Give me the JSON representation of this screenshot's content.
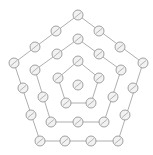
{
  "diagram": {
    "type": "concentric-pentagons",
    "colors": {
      "line": "#9a9a9a",
      "node_stroke": "#8a8a8a",
      "node_fill": "#f2f2f2",
      "background": "#ffffff"
    },
    "node_radius": 5,
    "rings": [
      {
        "name": "outer",
        "polygon": [
          [
            78,
            15
          ],
          [
            143,
            63
          ],
          [
            118,
            141
          ],
          [
            40,
            141
          ],
          [
            14,
            63
          ]
        ],
        "nodes": [
          [
            78,
            15
          ],
          [
            99,
            31
          ],
          [
            120,
            47
          ],
          [
            143,
            63
          ],
          [
            133,
            88
          ],
          [
            125,
            115
          ],
          [
            118,
            141
          ],
          [
            91,
            141
          ],
          [
            65,
            141
          ],
          [
            40,
            141
          ],
          [
            31,
            115
          ],
          [
            23,
            88
          ],
          [
            14,
            63
          ],
          [
            35,
            47
          ],
          [
            56,
            31
          ]
        ]
      },
      {
        "name": "middle",
        "polygon": [
          [
            78,
            39
          ],
          [
            121,
            70
          ],
          [
            104,
            122
          ],
          [
            51,
            122
          ],
          [
            35,
            70
          ]
        ],
        "nodes": [
          [
            78,
            39
          ],
          [
            99,
            54
          ],
          [
            121,
            70
          ],
          [
            113,
            97
          ],
          [
            104,
            122
          ],
          [
            78,
            122
          ],
          [
            51,
            122
          ],
          [
            43,
            97
          ],
          [
            35,
            70
          ],
          [
            57,
            54
          ]
        ]
      },
      {
        "name": "inner",
        "polygon": [
          [
            78,
            61
          ],
          [
            99,
            78
          ],
          [
            91,
            103
          ],
          [
            66,
            103
          ],
          [
            58,
            78
          ]
        ],
        "nodes": [
          [
            78,
            61
          ],
          [
            99,
            78
          ],
          [
            91,
            103
          ],
          [
            66,
            103
          ],
          [
            58,
            78
          ]
        ]
      }
    ],
    "center": [
      78,
      85
    ]
  }
}
